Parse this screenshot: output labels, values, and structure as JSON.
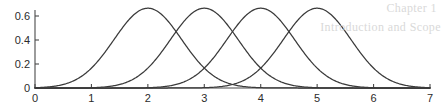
{
  "figure": {
    "background_color": "#ffffff",
    "line_color": "#3a3a3a",
    "axis_color": "#4a4a4a",
    "ghost_color": "#d9d9d9",
    "bleed_through_line_1": "Chapter 1",
    "bleed_through_line_2": "Introduction and Scope"
  },
  "chart_data": {
    "type": "line",
    "title": "",
    "subtitle": "",
    "xlabel": "",
    "ylabel": "",
    "xlim": [
      0,
      7
    ],
    "ylim": [
      0,
      0.72
    ],
    "grid": false,
    "legend": "none",
    "x_ticks": [
      0,
      1,
      2,
      3,
      4,
      5,
      6,
      7
    ],
    "x_tick_labels": [
      "0",
      "1",
      "2",
      "3",
      "4",
      "5",
      "6",
      "7"
    ],
    "y_ticks": [
      0,
      0.2,
      0.4,
      0.6
    ],
    "y_tick_labels": [
      "0",
      "0.2",
      "0.4",
      "0.6"
    ],
    "curve_family": "gaussian",
    "sigma": 0.6,
    "peak_value": 0.665,
    "series": [
      {
        "name": "gaussian-mu-2",
        "mu": 2,
        "sigma": 0.6,
        "peak": 0.665,
        "x": [
          0,
          0.25,
          0.5,
          0.75,
          1,
          1.25,
          1.5,
          1.75,
          2,
          2.25,
          2.5,
          2.75,
          3,
          3.25,
          3.5,
          3.75,
          4,
          4.5,
          5,
          6,
          7
        ],
        "values": [
          0.001,
          0.005,
          0.022,
          0.072,
          0.173,
          0.313,
          0.453,
          0.602,
          0.665,
          0.602,
          0.453,
          0.313,
          0.173,
          0.072,
          0.022,
          0.005,
          0.001,
          0.0,
          0.0,
          0.0,
          0.0
        ]
      },
      {
        "name": "gaussian-mu-3",
        "mu": 3,
        "sigma": 0.6,
        "peak": 0.665,
        "x": [
          0,
          1,
          1.25,
          1.5,
          1.75,
          2,
          2.25,
          2.5,
          2.75,
          3,
          3.25,
          3.5,
          3.75,
          4,
          4.25,
          4.5,
          4.75,
          5,
          6,
          7
        ],
        "values": [
          0.0,
          0.001,
          0.005,
          0.022,
          0.072,
          0.173,
          0.313,
          0.453,
          0.602,
          0.665,
          0.602,
          0.453,
          0.313,
          0.173,
          0.072,
          0.022,
          0.005,
          0.001,
          0.0,
          0.0
        ]
      },
      {
        "name": "gaussian-mu-4",
        "mu": 4,
        "sigma": 0.6,
        "peak": 0.665,
        "x": [
          0,
          1,
          2,
          2.25,
          2.5,
          2.75,
          3,
          3.25,
          3.5,
          3.75,
          4,
          4.25,
          4.5,
          4.75,
          5,
          5.25,
          5.5,
          5.75,
          6,
          7
        ],
        "values": [
          0.0,
          0.0,
          0.001,
          0.005,
          0.022,
          0.072,
          0.173,
          0.313,
          0.453,
          0.602,
          0.665,
          0.602,
          0.453,
          0.313,
          0.173,
          0.072,
          0.022,
          0.005,
          0.001,
          0.0
        ]
      },
      {
        "name": "gaussian-mu-5",
        "mu": 5,
        "sigma": 0.6,
        "peak": 0.665,
        "x": [
          0,
          1,
          2,
          3,
          3.25,
          3.5,
          3.75,
          4,
          4.25,
          4.5,
          4.75,
          5,
          5.25,
          5.5,
          5.75,
          6,
          6.25,
          6.5,
          6.75,
          7
        ],
        "values": [
          0.0,
          0.0,
          0.0,
          0.001,
          0.005,
          0.022,
          0.072,
          0.173,
          0.313,
          0.453,
          0.602,
          0.665,
          0.602,
          0.453,
          0.313,
          0.173,
          0.072,
          0.022,
          0.005,
          0.001
        ]
      }
    ]
  }
}
